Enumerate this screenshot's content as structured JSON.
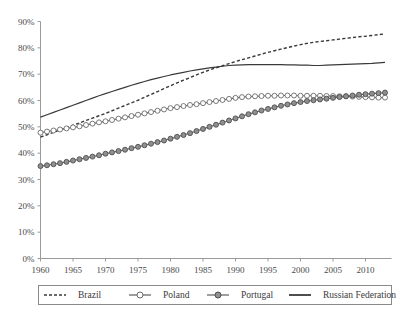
{
  "chart_data": {
    "type": "line",
    "title": "",
    "subtitle": "",
    "xlabel": "",
    "ylabel": "",
    "xlim": [
      1960,
      2014
    ],
    "ylim": [
      0,
      90
    ],
    "grid": false,
    "legend_position": "bottom",
    "x_tick_labels": [
      "1960",
      "1965",
      "1970",
      "1975",
      "1980",
      "1985",
      "1990",
      "1995",
      "2000",
      "2005",
      "2010"
    ],
    "x_ticks": [
      1960,
      1965,
      1970,
      1975,
      1980,
      1985,
      1990,
      1995,
      2000,
      2005,
      2010
    ],
    "y_tick_labels": [
      "0%",
      "10%",
      "20%",
      "30%",
      "40%",
      "50%",
      "60%",
      "70%",
      "80%",
      "90%"
    ],
    "y_ticks": [
      0,
      10,
      20,
      30,
      40,
      50,
      60,
      70,
      80,
      90
    ],
    "x": [
      1960,
      1961,
      1962,
      1963,
      1964,
      1965,
      1966,
      1967,
      1968,
      1969,
      1970,
      1971,
      1972,
      1973,
      1974,
      1975,
      1976,
      1977,
      1978,
      1979,
      1980,
      1981,
      1982,
      1983,
      1984,
      1985,
      1986,
      1987,
      1988,
      1989,
      1990,
      1991,
      1992,
      1993,
      1994,
      1995,
      1996,
      1997,
      1998,
      1999,
      2000,
      2001,
      2002,
      2003,
      2004,
      2005,
      2006,
      2007,
      2008,
      2009,
      2010,
      2011,
      2012,
      2013
    ],
    "series": [
      {
        "name": "Brazil",
        "style": "dashed",
        "marker": "none",
        "color": "#3a3a3a",
        "values": [
          46.1,
          47.0,
          47.9,
          48.8,
          49.7,
          50.6,
          51.5,
          52.4,
          53.3,
          54.2,
          55.1,
          56.1,
          57.1,
          58.1,
          59.1,
          60.1,
          61.2,
          62.3,
          63.4,
          64.5,
          65.6,
          66.7,
          67.7,
          68.7,
          69.7,
          70.7,
          71.6,
          72.4,
          73.2,
          74.0,
          74.8,
          75.5,
          76.2,
          76.9,
          77.6,
          78.3,
          78.9,
          79.5,
          80.1,
          80.7,
          81.2,
          81.7,
          82.1,
          82.4,
          82.7,
          83.0,
          83.3,
          83.6,
          83.9,
          84.2,
          84.4,
          84.7,
          85.0,
          85.3
        ]
      },
      {
        "name": "Poland",
        "style": "solid",
        "marker": "open-circle",
        "color": "#6a6a6a",
        "values": [
          47.8,
          48.2,
          48.6,
          49.0,
          49.4,
          49.8,
          50.2,
          50.7,
          51.2,
          51.7,
          52.1,
          52.6,
          53.1,
          53.6,
          54.1,
          54.6,
          55.1,
          55.6,
          56.1,
          56.6,
          57.1,
          57.5,
          57.9,
          58.3,
          58.6,
          59.0,
          59.4,
          59.8,
          60.2,
          60.6,
          61.0,
          61.3,
          61.5,
          61.6,
          61.7,
          61.8,
          61.8,
          61.9,
          61.9,
          61.9,
          61.8,
          61.8,
          61.8,
          61.8,
          61.7,
          61.7,
          61.6,
          61.6,
          61.5,
          61.4,
          61.3,
          61.2,
          61.1,
          61.1
        ]
      },
      {
        "name": "Portugal",
        "style": "solid",
        "marker": "filled-circle",
        "color": "#6a6a6a",
        "values": [
          35.1,
          35.4,
          35.8,
          36.2,
          36.7,
          37.2,
          37.7,
          38.2,
          38.7,
          39.2,
          39.8,
          40.3,
          40.8,
          41.3,
          41.9,
          42.4,
          43.0,
          43.6,
          44.2,
          44.8,
          45.5,
          46.2,
          46.9,
          47.6,
          48.4,
          49.2,
          50.0,
          50.8,
          51.6,
          52.4,
          53.2,
          54.0,
          54.8,
          55.5,
          56.2,
          56.8,
          57.4,
          58.0,
          58.5,
          59.0,
          59.4,
          59.8,
          60.1,
          60.4,
          60.7,
          61.0,
          61.3,
          61.6,
          61.9,
          62.2,
          62.4,
          62.6,
          62.8,
          63.0
        ]
      },
      {
        "name": "Russian Federation",
        "style": "solid",
        "marker": "none",
        "color": "#3a3a3a",
        "values": [
          53.7,
          54.6,
          55.5,
          56.4,
          57.3,
          58.2,
          59.1,
          60.0,
          60.9,
          61.8,
          62.6,
          63.4,
          64.2,
          65.0,
          65.8,
          66.5,
          67.2,
          67.9,
          68.5,
          69.1,
          69.7,
          70.2,
          70.7,
          71.2,
          71.6,
          72.0,
          72.4,
          72.7,
          73.0,
          73.3,
          73.4,
          73.5,
          73.6,
          73.6,
          73.6,
          73.6,
          73.6,
          73.6,
          73.5,
          73.5,
          73.4,
          73.4,
          73.3,
          73.3,
          73.4,
          73.5,
          73.6,
          73.7,
          73.8,
          73.9,
          74.0,
          74.1,
          74.3,
          74.5
        ]
      }
    ],
    "legend": [
      {
        "label": "Brazil",
        "marker": "dashed-line"
      },
      {
        "label": "Poland",
        "marker": "line-open-circle"
      },
      {
        "label": "Portugal",
        "marker": "line-filled-circle"
      },
      {
        "label": "Russian Federation",
        "marker": "solid-line"
      }
    ],
    "colors": {
      "axis": "#9a9a9a",
      "text": "#3a3a3a",
      "brazil": "#3a3a3a",
      "poland": "#6a6a6a",
      "portugal": "#8a8a8a",
      "russia": "#3a3a3a",
      "background": "#ffffff",
      "legend_border": "#8a8a8a"
    }
  }
}
